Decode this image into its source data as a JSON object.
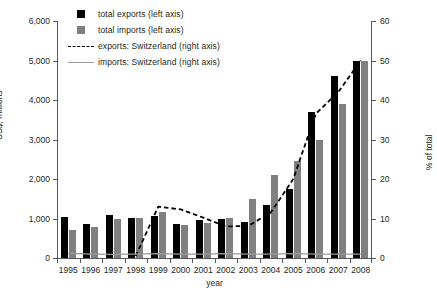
{
  "legend": {
    "items": [
      {
        "label": "total exports (left axis)",
        "key": "square-black-icon"
      },
      {
        "label": "total imports (left axis)",
        "key": "square-gray-icon"
      },
      {
        "label": "exports: Switzerland (right axis)",
        "key": "dashed-line-icon"
      },
      {
        "label": "imports: Switzerland (right axis)",
        "key": "solid-line-icon"
      }
    ]
  },
  "colors": {
    "exports_bar": "#000000",
    "imports_bar": "#808080",
    "exports_line": "#000000",
    "imports_line": "#9a9a9a",
    "axis": "#58595b"
  },
  "chart_data": {
    "type": "bar",
    "title": "",
    "xlabel": "year",
    "ylabel": "US$, millions",
    "y2label": "% of total",
    "categories": [
      "1995",
      "1996",
      "1997",
      "1998",
      "1999",
      "2000",
      "2001",
      "2002",
      "2003",
      "2004",
      "2005",
      "2006",
      "2007",
      "2008"
    ],
    "ylim": [
      0,
      6000
    ],
    "yticks": [
      0,
      1000,
      2000,
      3000,
      4000,
      5000,
      6000
    ],
    "yticklabels": [
      "0",
      "1,000",
      "2,000",
      "3,000",
      "4,000",
      "5,000",
      "6,000"
    ],
    "y2lim": [
      0,
      60
    ],
    "y2ticks": [
      0,
      10,
      20,
      30,
      40,
      50,
      60
    ],
    "y2ticklabels": [
      "0",
      "10",
      "20",
      "30",
      "40",
      "50",
      "60"
    ],
    "grid": false,
    "legend_position": "top-left",
    "series": [
      {
        "name": "total exports (left axis)",
        "axis": "left",
        "kind": "bar",
        "values": [
          1050,
          850,
          1100,
          1020,
          1060,
          870,
          950,
          1000,
          900,
          1350,
          1750,
          3700,
          4600,
          5000
        ]
      },
      {
        "name": "total imports (left axis)",
        "axis": "left",
        "kind": "bar",
        "values": [
          700,
          790,
          1000,
          1010,
          1160,
          830,
          880,
          1020,
          1500,
          2100,
          2450,
          3000,
          3900,
          5000
        ]
      },
      {
        "name": "exports: Switzerland (right axis)",
        "axis": "right",
        "kind": "line",
        "style": "dashed",
        "values": [
          null,
          null,
          null,
          0.5,
          13.0,
          12.3,
          10.2,
          8.0,
          8.1,
          11.5,
          20.0,
          36.5,
          42.0,
          50.0
        ]
      },
      {
        "name": "imports: Switzerland (right axis)",
        "axis": "right",
        "kind": "line",
        "style": "solid",
        "values": [
          1.2,
          1.0,
          0.9,
          1.0,
          1.1,
          1.0,
          1.0,
          1.1,
          1.0,
          1.0,
          1.1,
          1.0,
          1.0,
          1.0
        ]
      }
    ]
  }
}
